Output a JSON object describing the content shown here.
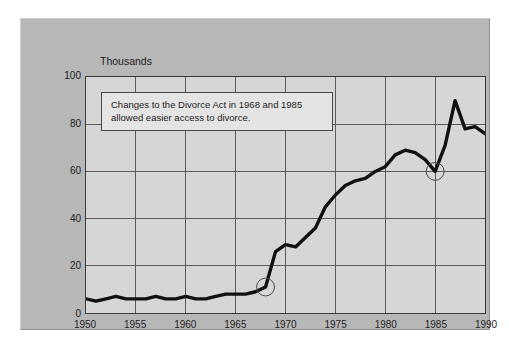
{
  "chart_data": {
    "type": "line",
    "title": "",
    "subtitle": "",
    "unit_label": "Thousands",
    "xlabel": "",
    "ylabel": "Thousands",
    "xlim": [
      1950,
      1990
    ],
    "ylim": [
      0,
      100
    ],
    "grid": true,
    "legend": "none",
    "y_ticks": [
      100,
      80,
      60,
      40,
      20,
      0
    ],
    "x_ticks": [
      1950,
      1955,
      1960,
      1965,
      1970,
      1975,
      1980,
      1985,
      1990
    ],
    "y_gridline_values": [
      20,
      40,
      60,
      80
    ],
    "x_gridline_values": [
      1955,
      1960,
      1965,
      1970,
      1975,
      1980,
      1985
    ],
    "series": [
      {
        "name": "Divorces",
        "color": "#111111",
        "x": [
          1950,
          1951,
          1952,
          1953,
          1954,
          1955,
          1956,
          1957,
          1958,
          1959,
          1960,
          1961,
          1962,
          1963,
          1964,
          1965,
          1966,
          1967,
          1968,
          1969,
          1970,
          1971,
          1972,
          1973,
          1974,
          1975,
          1976,
          1977,
          1978,
          1979,
          1980,
          1981,
          1982,
          1983,
          1984,
          1985,
          1986,
          1987,
          1988,
          1989,
          1990
        ],
        "values": [
          6,
          5,
          6,
          7,
          6,
          6,
          6,
          7,
          6,
          6,
          7,
          6,
          6,
          7,
          8,
          8,
          8,
          9,
          11,
          26,
          29,
          28,
          32,
          36,
          45,
          50,
          54,
          56,
          57,
          60,
          62,
          67,
          69,
          68,
          65,
          60,
          71,
          90,
          78,
          79,
          76
        ]
      }
    ],
    "markers": [
      {
        "name": "marker-1968",
        "x": 1968,
        "y": 11,
        "shape": "open-circle"
      },
      {
        "name": "marker-1985",
        "x": 1985,
        "y": 60,
        "shape": "open-circle"
      }
    ],
    "annotations": [
      {
        "name": "divorce-act-note",
        "lines": [
          "Changes to the Divorce Act in 1968 and 1985",
          "allowed easier access to divorce."
        ]
      }
    ],
    "colors": {
      "page_background": "#ffffff",
      "panel_background": "#b7b7b7",
      "plot_background": "#d6d6d6",
      "grid": "#5a5a5a",
      "axis": "#3a3a3a",
      "line": "#111111",
      "annotation_background": "#e4e4e4",
      "annotation_border": "#4a4a4a",
      "text": "#222222"
    }
  }
}
